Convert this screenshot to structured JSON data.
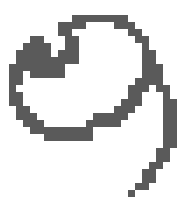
{
  "image": {
    "description": "Pixelated handwritten glyph resembling a curled script character",
    "ink_color": "#5a5a5a",
    "background_color": "#ffffff"
  }
}
